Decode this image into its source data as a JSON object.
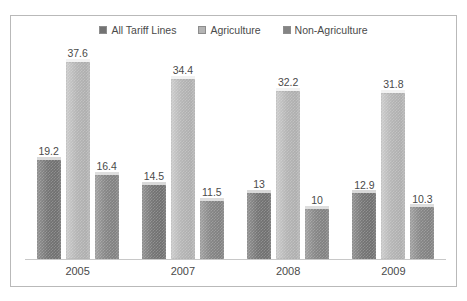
{
  "legend": {
    "position": "top",
    "items": [
      {
        "label": "All Tariff Lines",
        "color": "#737373",
        "icon": "legend-swatch-icon"
      },
      {
        "label": "Agriculture",
        "color": "#b4b4b4",
        "icon": "legend-swatch-icon"
      },
      {
        "label": "Non-Agriculture",
        "color": "#848484",
        "icon": "legend-swatch-icon"
      }
    ]
  },
  "chart_data": {
    "type": "bar",
    "title": "",
    "subtitle": "",
    "xlabel": "",
    "ylabel": "",
    "grid": false,
    "legend_position": "top",
    "axis_visible": {
      "x": true,
      "y": false
    },
    "ylim": [
      0,
      40
    ],
    "categories": [
      "2005",
      "2007",
      "2008",
      "2009"
    ],
    "series": [
      {
        "name": "All Tariff Lines",
        "color": "#737373",
        "values": [
          19.2,
          14.5,
          13,
          12.9
        ]
      },
      {
        "name": "Agriculture",
        "color": "#b4b4b4",
        "values": [
          37.6,
          34.4,
          32.2,
          31.8
        ]
      },
      {
        "name": "Non-Agriculture",
        "color": "#848484",
        "values": [
          16.4,
          11.5,
          10,
          10.3
        ]
      }
    ],
    "data_labels": [
      [
        "19.2",
        "37.6",
        "16.4"
      ],
      [
        "14.5",
        "34.4",
        "11.5"
      ],
      [
        "13",
        "32.2",
        "10"
      ],
      [
        "12.9",
        "31.8",
        "10.3"
      ]
    ]
  },
  "colors": {
    "frame_border": "#b9b9b9",
    "baseline": "#c8c8c8",
    "text": "#4a4a4a",
    "background": "#ffffff"
  }
}
